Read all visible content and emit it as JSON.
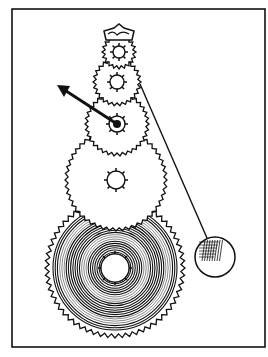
{
  "illustration": {
    "subject": "clock gear train with pendulum",
    "colors": {
      "ink": "#111111",
      "paper": "#ffffff"
    },
    "frame": {
      "x": 12,
      "y": 9,
      "w": 253,
      "h": 338
    },
    "crown": {
      "cx": 119,
      "cy": 33
    },
    "gears": [
      {
        "name": "escape-wheel",
        "cx": 119,
        "cy": 52,
        "r": 14,
        "hub": 6
      },
      {
        "name": "second-wheel",
        "cx": 117,
        "cy": 82,
        "r": 21,
        "hub": 7
      },
      {
        "name": "center-wheel",
        "cx": 117,
        "cy": 124,
        "r": 29,
        "hub": 8
      },
      {
        "name": "third-wheel",
        "cx": 116,
        "cy": 180,
        "r": 48,
        "hub": 9
      },
      {
        "name": "great-wheel",
        "cx": 115,
        "cy": 268,
        "r": 66,
        "hub": 14
      }
    ],
    "hand": {
      "x1": 57,
      "y1": 85,
      "x2": 117,
      "y2": 124
    },
    "pendulum": {
      "rod_x1": 140,
      "rod_y1": 84,
      "rod_x2": 207,
      "rod_y2": 238,
      "bob_cx": 215,
      "bob_cy": 257,
      "bob_r": 20
    }
  }
}
